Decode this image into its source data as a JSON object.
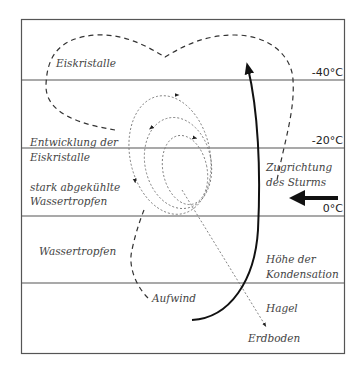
{
  "diagram": {
    "temperatures": {
      "minus40": "-40°C",
      "minus20": "-20°C",
      "zero": "0°C"
    },
    "labels": {
      "eiskristalle": "Eiskristalle",
      "entwicklung_1": "Entwicklung der",
      "entwicklung_2": "Eiskristalle",
      "stark_1": "stark abgekühlte",
      "stark_2": "Wassertropfen",
      "wassertropfen": "Wassertropfen",
      "zugrichtung_1": "Zugrichtung",
      "zugrichtung_2": "des Sturms",
      "hoehe_1": "Höhe der",
      "hoehe_2": "Kondensation",
      "aufwind": "Aufwind",
      "hagel": "Hagel",
      "erdboden": "Erdboden"
    }
  }
}
